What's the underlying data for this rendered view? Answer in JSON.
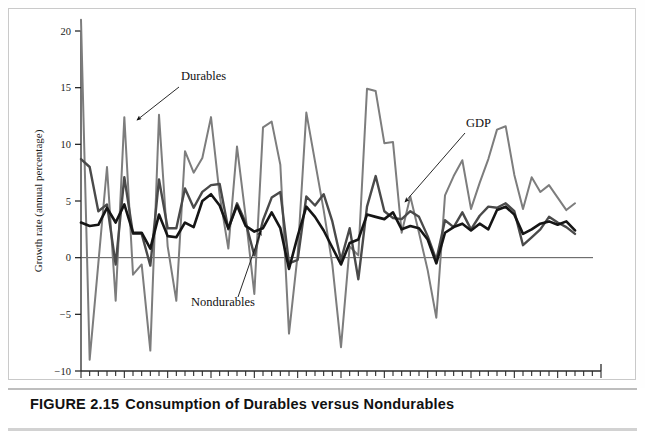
{
  "figure": {
    "caption_number": "FIGURE 2.15",
    "caption_title": "Consumption of Durables versus Nondurables"
  },
  "chart_data": {
    "type": "line",
    "title": "Consumption of Durables versus Nondurables",
    "xlabel": "Year",
    "ylabel": "Growth rate (annual percentage)",
    "xlim": [
      1950,
      2010
    ],
    "ylim": [
      -10,
      20
    ],
    "xticks": [
      1950,
      1955,
      1960,
      1965,
      1970,
      1975,
      1980,
      1985,
      1990,
      1995,
      2000,
      2005,
      2010
    ],
    "xtick_labels": [
      "1950",
      "1955",
      "1960",
      "1965",
      "1970",
      "1975",
      "1980",
      "1985",
      "1990",
      "1995",
      "2000",
      "2005",
      "2010"
    ],
    "xminor_interval": 1,
    "yticks": [
      -10,
      -5,
      0,
      5,
      10,
      15,
      20
    ],
    "ytick_labels": [
      "−10",
      "−5",
      "0",
      "5",
      "10",
      "15",
      "20"
    ],
    "grid": false,
    "zero_line": true,
    "legend_position": "inline-annotations",
    "x": [
      1950,
      1951,
      1952,
      1953,
      1954,
      1955,
      1956,
      1957,
      1958,
      1959,
      1960,
      1961,
      1962,
      1963,
      1964,
      1965,
      1966,
      1967,
      1968,
      1969,
      1970,
      1971,
      1972,
      1973,
      1974,
      1975,
      1976,
      1977,
      1978,
      1979,
      1980,
      1981,
      1982,
      1983,
      1984,
      1985,
      1986,
      1987,
      1988,
      1989,
      1990,
      1991,
      1992,
      1993,
      1994,
      1995,
      1996,
      1997,
      1998,
      1999,
      2000,
      2001,
      2002,
      2003,
      2004,
      2005,
      2006,
      2007
    ],
    "series": [
      {
        "name": "Durables",
        "color": "#7d7d7d",
        "width": 2.0,
        "values": [
          21.0,
          -9.0,
          -0.5,
          8.0,
          -3.8,
          12.4,
          -1.5,
          -0.6,
          -8.2,
          12.6,
          1.0,
          -3.8,
          9.4,
          7.5,
          8.8,
          12.4,
          5.5,
          0.8,
          9.8,
          3.6,
          -3.2,
          11.5,
          12.0,
          8.2,
          -6.7,
          0.3,
          12.8,
          8.5,
          4.2,
          -0.6,
          -7.9,
          1.0,
          0.2,
          14.9,
          14.7,
          10.1,
          10.2,
          2.2,
          5.4,
          2.2,
          -1.1,
          -5.3,
          5.5,
          7.2,
          8.6,
          4.3,
          6.6,
          8.7,
          11.3,
          11.6,
          7.3,
          4.3,
          7.1,
          5.8,
          6.4,
          5.3,
          4.2,
          4.8
        ]
      },
      {
        "name": "GDP",
        "color": "#4a4a4a",
        "width": 2.4,
        "values": [
          8.7,
          8.0,
          4.1,
          4.7,
          -0.6,
          7.1,
          2.1,
          2.1,
          -0.7,
          6.9,
          2.6,
          2.6,
          6.1,
          4.4,
          5.8,
          6.4,
          6.5,
          2.5,
          4.8,
          3.1,
          0.2,
          3.3,
          5.3,
          5.8,
          -0.5,
          -0.2,
          5.4,
          4.6,
          5.6,
          3.2,
          -0.2,
          2.6,
          -1.9,
          4.5,
          7.2,
          4.1,
          3.5,
          3.4,
          4.1,
          3.6,
          1.9,
          -0.2,
          3.3,
          2.7,
          4.0,
          2.5,
          3.7,
          4.5,
          4.4,
          4.8,
          4.1,
          1.1,
          1.8,
          2.5,
          3.6,
          3.1,
          2.7,
          2.1
        ]
      },
      {
        "name": "Nondurables",
        "color": "#151515",
        "width": 2.6,
        "values": [
          3.1,
          2.8,
          2.9,
          4.4,
          3.1,
          4.7,
          2.2,
          2.2,
          0.8,
          3.8,
          1.9,
          1.8,
          3.1,
          2.7,
          5.0,
          5.6,
          4.6,
          2.6,
          4.6,
          2.8,
          2.3,
          2.6,
          4.0,
          2.6,
          -1.0,
          1.9,
          4.5,
          3.6,
          2.4,
          0.9,
          -0.6,
          1.3,
          1.6,
          3.8,
          3.6,
          3.4,
          4.0,
          2.5,
          2.8,
          2.6,
          1.6,
          -0.5,
          2.2,
          2.7,
          3.0,
          2.4,
          3.0,
          2.5,
          4.2,
          4.5,
          3.8,
          2.1,
          2.5,
          3.0,
          3.2,
          2.9,
          3.2,
          2.4
        ]
      }
    ],
    "annotations": [
      {
        "name": "Durables",
        "label": "Durables",
        "label_x": 172,
        "label_y": 71,
        "arrow_from_x": 170,
        "arrow_from_y": 78,
        "arrow_to_x": 128,
        "arrow_to_y": 111
      },
      {
        "name": "GDP",
        "label": "GDP",
        "label_x": 457,
        "label_y": 118,
        "arrow_from_x": 456,
        "arrow_from_y": 124,
        "arrow_to_x": 396,
        "arrow_to_y": 193
      },
      {
        "name": "Nondurables",
        "label": "Nondurables",
        "label_x": 182,
        "label_y": 297,
        "arrow_from_x": 229,
        "arrow_from_y": 288,
        "arrow_to_x": 252,
        "arrow_to_y": 222
      }
    ]
  }
}
